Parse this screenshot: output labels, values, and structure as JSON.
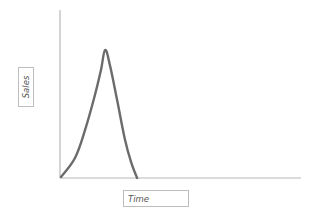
{
  "chart_data": {
    "type": "line",
    "title": "",
    "xlabel": "Time",
    "ylabel": "Sales",
    "xlim": [
      0,
      100
    ],
    "ylim": [
      0,
      100
    ],
    "grid": false,
    "legend": null,
    "ticks": false,
    "series": [
      {
        "name": "Sales",
        "color": "#6b6b6b",
        "x": [
          0.4,
          6.2,
          10.4,
          14.5,
          17.0,
          18.7,
          20.7,
          23.7,
          27.0,
          29.5,
          32.0
        ],
        "y": [
          0.6,
          11.9,
          28.6,
          49.4,
          64.3,
          76.2,
          67.3,
          46.4,
          22.6,
          9.5,
          0.0
        ]
      }
    ],
    "annotations": []
  },
  "plot": {
    "origin_px": [
      60,
      178
    ],
    "x_end_px": 301,
    "y_top_px": 10,
    "axis_color": "#b8b8b8",
    "line_color": "#6b6b6b"
  },
  "labels": {
    "y": "Sales",
    "x": "Time"
  }
}
